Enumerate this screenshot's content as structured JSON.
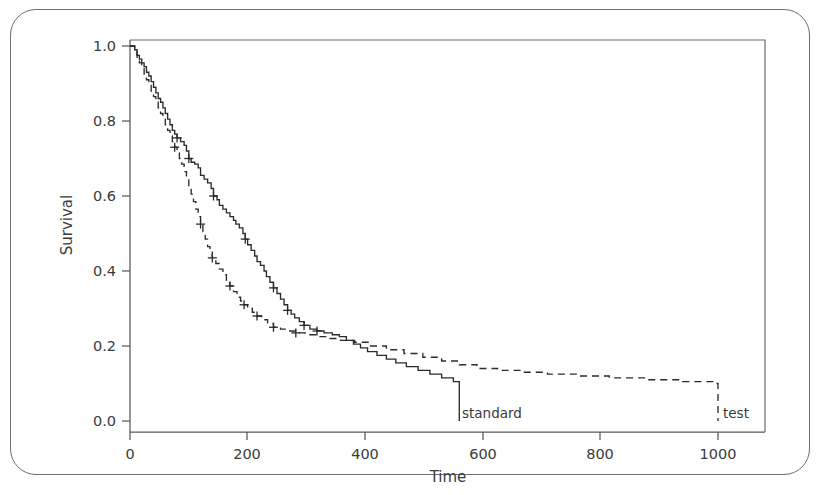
{
  "figure": {
    "background_color": "#ffffff",
    "frame_color": "#6e6e6e",
    "ink_color": "#2b2b2b"
  },
  "axes": {
    "y_title": "Survival",
    "x_title": "Time"
  },
  "chart_data": {
    "type": "line",
    "title": "",
    "subtitle": "",
    "xlabel": "Time",
    "ylabel": "Survival",
    "xlim": [
      -40,
      1090
    ],
    "ylim": [
      -0.03,
      1.03
    ],
    "xticks": [
      0,
      200,
      400,
      600,
      800,
      1000
    ],
    "xtick_labels": [
      "0",
      "200",
      "400",
      "600",
      "800",
      "1000"
    ],
    "yticks": [
      0.0,
      0.2,
      0.4,
      0.6,
      0.8,
      1.0
    ],
    "ytick_labels": [
      "0.0",
      "0.2",
      "0.4",
      "0.6",
      "0.8",
      "1.0"
    ],
    "grid": false,
    "legend_position": "inline-end-of-curve",
    "series": [
      {
        "name": "standard",
        "label": "standard",
        "style": "solid",
        "color": "#2b2b2b",
        "label_x": 560,
        "label_y": 0.0,
        "points": [
          [
            0,
            1.0
          ],
          [
            8,
            0.99
          ],
          [
            12,
            0.975
          ],
          [
            16,
            0.965
          ],
          [
            20,
            0.955
          ],
          [
            24,
            0.945
          ],
          [
            28,
            0.93
          ],
          [
            32,
            0.92
          ],
          [
            36,
            0.905
          ],
          [
            40,
            0.89
          ],
          [
            44,
            0.875
          ],
          [
            48,
            0.86
          ],
          [
            52,
            0.85
          ],
          [
            56,
            0.835
          ],
          [
            60,
            0.82
          ],
          [
            64,
            0.805
          ],
          [
            68,
            0.79
          ],
          [
            72,
            0.775
          ],
          [
            76,
            0.765
          ],
          [
            80,
            0.755
          ],
          [
            86,
            0.745
          ],
          [
            92,
            0.735
          ],
          [
            96,
            0.72
          ],
          [
            100,
            0.7
          ],
          [
            104,
            0.69
          ],
          [
            110,
            0.685
          ],
          [
            116,
            0.675
          ],
          [
            120,
            0.655
          ],
          [
            126,
            0.645
          ],
          [
            132,
            0.635
          ],
          [
            138,
            0.62
          ],
          [
            142,
            0.6
          ],
          [
            148,
            0.59
          ],
          [
            152,
            0.575
          ],
          [
            158,
            0.565
          ],
          [
            164,
            0.555
          ],
          [
            170,
            0.545
          ],
          [
            176,
            0.535
          ],
          [
            180,
            0.525
          ],
          [
            186,
            0.515
          ],
          [
            192,
            0.5
          ],
          [
            196,
            0.485
          ],
          [
            200,
            0.47
          ],
          [
            206,
            0.455
          ],
          [
            212,
            0.44
          ],
          [
            216,
            0.425
          ],
          [
            222,
            0.415
          ],
          [
            228,
            0.4
          ],
          [
            232,
            0.385
          ],
          [
            238,
            0.37
          ],
          [
            244,
            0.355
          ],
          [
            250,
            0.34
          ],
          [
            256,
            0.325
          ],
          [
            262,
            0.31
          ],
          [
            268,
            0.295
          ],
          [
            274,
            0.285
          ],
          [
            280,
            0.275
          ],
          [
            288,
            0.265
          ],
          [
            296,
            0.255
          ],
          [
            306,
            0.245
          ],
          [
            318,
            0.24
          ],
          [
            330,
            0.235
          ],
          [
            344,
            0.23
          ],
          [
            356,
            0.225
          ],
          [
            368,
            0.215
          ],
          [
            380,
            0.205
          ],
          [
            392,
            0.195
          ],
          [
            404,
            0.185
          ],
          [
            420,
            0.175
          ],
          [
            436,
            0.165
          ],
          [
            452,
            0.155
          ],
          [
            470,
            0.145
          ],
          [
            490,
            0.135
          ],
          [
            510,
            0.125
          ],
          [
            530,
            0.115
          ],
          [
            550,
            0.105
          ],
          [
            575,
            0.095
          ],
          [
            600,
            0.085
          ],
          [
            625,
            0.075
          ],
          [
            650,
            0.07
          ],
          [
            680,
            0.065
          ],
          [
            710,
            0.06
          ],
          [
            745,
            0.055
          ],
          [
            780,
            0.05
          ],
          [
            820,
            0.045
          ],
          [
            870,
            0.04
          ],
          [
            920,
            0.035
          ],
          [
            975,
            0.03
          ],
          [
            1000,
            0.03
          ]
        ],
        "censor_marks": [
          [
            80,
            0.755
          ],
          [
            100,
            0.7
          ],
          [
            142,
            0.6
          ],
          [
            196,
            0.485
          ],
          [
            244,
            0.355
          ],
          [
            268,
            0.295
          ],
          [
            296,
            0.255
          ],
          [
            318,
            0.24
          ]
        ]
      },
      {
        "name": "test",
        "label": "test",
        "style": "dashed",
        "color": "#2b2b2b",
        "label_x": 1000,
        "label_y": 0.0,
        "points": [
          [
            0,
            1.0
          ],
          [
            8,
            0.985
          ],
          [
            12,
            0.97
          ],
          [
            16,
            0.955
          ],
          [
            20,
            0.94
          ],
          [
            24,
            0.925
          ],
          [
            28,
            0.91
          ],
          [
            32,
            0.895
          ],
          [
            36,
            0.88
          ],
          [
            40,
            0.865
          ],
          [
            44,
            0.85
          ],
          [
            48,
            0.835
          ],
          [
            52,
            0.82
          ],
          [
            56,
            0.805
          ],
          [
            60,
            0.79
          ],
          [
            64,
            0.775
          ],
          [
            68,
            0.76
          ],
          [
            72,
            0.745
          ],
          [
            76,
            0.73
          ],
          [
            80,
            0.715
          ],
          [
            84,
            0.7
          ],
          [
            88,
            0.685
          ],
          [
            92,
            0.665
          ],
          [
            96,
            0.645
          ],
          [
            100,
            0.625
          ],
          [
            104,
            0.605
          ],
          [
            108,
            0.585
          ],
          [
            112,
            0.565
          ],
          [
            116,
            0.545
          ],
          [
            120,
            0.525
          ],
          [
            124,
            0.505
          ],
          [
            128,
            0.485
          ],
          [
            132,
            0.465
          ],
          [
            136,
            0.45
          ],
          [
            140,
            0.435
          ],
          [
            146,
            0.42
          ],
          [
            152,
            0.405
          ],
          [
            158,
            0.39
          ],
          [
            164,
            0.375
          ],
          [
            170,
            0.36
          ],
          [
            176,
            0.345
          ],
          [
            182,
            0.33
          ],
          [
            188,
            0.32
          ],
          [
            194,
            0.31
          ],
          [
            200,
            0.3
          ],
          [
            208,
            0.29
          ],
          [
            216,
            0.28
          ],
          [
            224,
            0.27
          ],
          [
            234,
            0.26
          ],
          [
            244,
            0.25
          ],
          [
            256,
            0.245
          ],
          [
            268,
            0.24
          ],
          [
            282,
            0.235
          ],
          [
            298,
            0.23
          ],
          [
            316,
            0.225
          ],
          [
            336,
            0.22
          ],
          [
            358,
            0.215
          ],
          [
            382,
            0.21
          ],
          [
            408,
            0.2
          ],
          [
            436,
            0.19
          ],
          [
            466,
            0.18
          ],
          [
            498,
            0.17
          ],
          [
            530,
            0.16
          ],
          [
            560,
            0.15
          ],
          [
            590,
            0.14
          ],
          [
            625,
            0.135
          ],
          [
            665,
            0.13
          ],
          [
            710,
            0.125
          ],
          [
            760,
            0.12
          ],
          [
            815,
            0.115
          ],
          [
            875,
            0.11
          ],
          [
            940,
            0.105
          ],
          [
            995,
            0.1
          ],
          [
            1000,
            0.1
          ]
        ],
        "censor_marks": [
          [
            76,
            0.73
          ],
          [
            120,
            0.525
          ],
          [
            140,
            0.435
          ],
          [
            170,
            0.36
          ],
          [
            194,
            0.31
          ],
          [
            216,
            0.28
          ],
          [
            244,
            0.25
          ],
          [
            282,
            0.235
          ]
        ]
      }
    ]
  }
}
